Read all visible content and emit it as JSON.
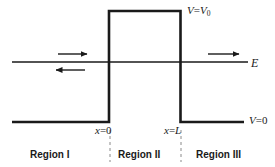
{
  "figure": {
    "line_color": "#1a1a1a",
    "background_color": "#ffffff",
    "dashed_color": "#8a8a8a"
  },
  "labels": {
    "barrier_potential": {
      "symbol": "V",
      "operator": "=",
      "value": "V",
      "subscript": "0",
      "text": "V = V0"
    },
    "energy": {
      "symbol": "E",
      "text": "E"
    },
    "outside_potential": {
      "symbol": "V",
      "operator": "=",
      "value": "0",
      "text": "V = 0"
    },
    "left_edge": {
      "symbol": "x",
      "operator": "=",
      "value": "0",
      "text": "x = 0"
    },
    "right_edge": {
      "symbol": "x",
      "operator": "=",
      "value": "L",
      "text": "x = L"
    }
  },
  "regions": [
    {
      "name": "region-1",
      "label": "Region I"
    },
    {
      "name": "region-2",
      "label": "Region II"
    },
    {
      "name": "region-3",
      "label": "Region III"
    }
  ],
  "arrows": [
    {
      "name": "incident-wave-arrow",
      "direction": "right",
      "region": "Region I",
      "x1": 58,
      "y1": 54,
      "x2": 88,
      "y2": 54
    },
    {
      "name": "reflected-wave-arrow",
      "direction": "left",
      "region": "Region I",
      "x1": 85,
      "y1": 70,
      "x2": 55,
      "y2": 70
    },
    {
      "name": "transmitted-wave-arrow",
      "direction": "right",
      "region": "Region III",
      "x1": 208,
      "y1": 54,
      "x2": 240,
      "y2": 54
    }
  ],
  "geometry": {
    "barrier_left_x": 109,
    "barrier_right_x": 180.5,
    "barrier_top_y": 11,
    "baseline_y": 122,
    "energy_line_y": 62,
    "baseline_left_start_x": 12,
    "baseline_right_end_x": 244,
    "energy_line_start_x": 12,
    "energy_line_end_x": 248,
    "dashed_top_y": 130,
    "dashed_bottom_y": 162
  }
}
